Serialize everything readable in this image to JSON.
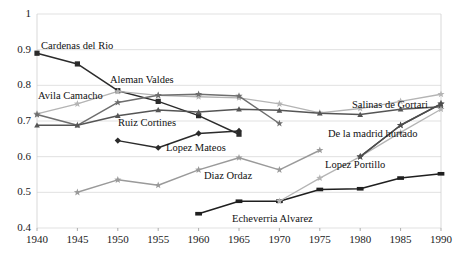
{
  "chart_data": {
    "type": "line",
    "title": "",
    "subtitle": "",
    "xlabel": "",
    "ylabel": "",
    "x": [
      1940,
      1945,
      1950,
      1955,
      1960,
      1965,
      1970,
      1975,
      1980,
      1985,
      1990
    ],
    "xlim": [
      1940,
      1990
    ],
    "ylim": [
      0.4,
      1.0
    ],
    "xticks": [
      "1940",
      "1945",
      "1950",
      "1955",
      "1960",
      "1965",
      "1970",
      "1975",
      "1980",
      "1985",
      "1990"
    ],
    "yticks": [
      "1",
      "0.9",
      "0.8",
      "0.7",
      "0.6",
      "0.5",
      "0.4"
    ],
    "ytick_values": [
      1,
      0.9,
      0.8,
      0.7,
      0.6,
      0.5,
      0.4
    ],
    "grid": true,
    "grid_axis": "y",
    "legend": "inline-annotations",
    "legend_position": "none",
    "marker": "star-square",
    "series": [
      {
        "name": "Cardenas del Rio",
        "color": "#2b2b2b",
        "marker": "square",
        "x": [
          1940,
          1945,
          1950,
          1955,
          1960,
          1965
        ],
        "values": [
          0.89,
          0.86,
          0.785,
          0.755,
          0.715,
          0.663
        ]
      },
      {
        "name": "Avila Camacho",
        "color": "#b4b4b4",
        "marker": "star",
        "x": [
          1940,
          1945,
          1950,
          1955,
          1960,
          1965,
          1970,
          1975,
          1980,
          1985,
          1990
        ],
        "values": [
          0.72,
          0.748,
          0.783,
          0.772,
          0.768,
          0.765,
          0.748,
          0.723,
          0.735,
          0.755,
          0.775
        ]
      },
      {
        "name": "Aleman Valdes",
        "color": "#6e6e6e",
        "marker": "star",
        "x": [
          1940,
          1945,
          1950,
          1955,
          1960,
          1965,
          1970
        ],
        "values": [
          0.718,
          0.688,
          0.752,
          0.772,
          0.775,
          0.77,
          0.693
        ]
      },
      {
        "name": "Ruiz Cortines",
        "color": "#555555",
        "marker": "triangle",
        "x": [
          1940,
          1945,
          1950,
          1955,
          1960,
          1965,
          1970,
          1975,
          1980,
          1985,
          1990
        ],
        "values": [
          0.688,
          0.688,
          0.715,
          0.731,
          0.725,
          0.733,
          0.73,
          0.722,
          0.718,
          0.733,
          0.74
        ]
      },
      {
        "name": "Lopez Mateos",
        "color": "#2b2b2b",
        "marker": "diamond",
        "x": [
          1950,
          1955,
          1960,
          1965
        ],
        "values": [
          0.645,
          0.625,
          0.665,
          0.672
        ]
      },
      {
        "name": "Diaz Ordaz",
        "color": "#9a9a9a",
        "marker": "star",
        "x": [
          1945,
          1950,
          1955,
          1960,
          1965,
          1970,
          1975
        ],
        "values": [
          0.5,
          0.535,
          0.52,
          0.563,
          0.597,
          0.563,
          0.618
        ]
      },
      {
        "name": "Echeverria Alvarez",
        "color": "#1f1f1f",
        "marker": "bar",
        "x": [
          1960,
          1965,
          1970,
          1975,
          1980,
          1985,
          1990
        ],
        "values": [
          0.44,
          0.475,
          0.475,
          0.508,
          0.51,
          0.54,
          0.552
        ]
      },
      {
        "name": "Lopez Portillo",
        "color": "#b4b4b4",
        "marker": "star",
        "x": [
          1970,
          1975,
          1980,
          1985,
          1990
        ],
        "values": [
          0.475,
          0.54,
          0.6,
          0.668,
          0.733
        ]
      },
      {
        "name": "De la madrid hurtado",
        "color": "#4d4d4d",
        "marker": "star",
        "x": [
          1980,
          1985,
          1990
        ],
        "values": [
          0.6,
          0.688,
          0.748
        ]
      },
      {
        "name": "Salinas de Gortari",
        "color": "#4d4d4d",
        "marker": "star",
        "x": [
          1980,
          1985,
          1990
        ],
        "values": [
          0.6,
          0.688,
          0.748
        ]
      }
    ],
    "annotations": [
      {
        "text": "Cardenas del Rio",
        "x": 41,
        "y": 40,
        "color": "#111111"
      },
      {
        "text": "Avila Camacho",
        "x": 38,
        "y": 90,
        "color": "#111111"
      },
      {
        "text": "Aleman Valdes",
        "x": 110,
        "y": 74,
        "color": "#111111"
      },
      {
        "text": "Ruiz Cortines",
        "x": 118,
        "y": 117,
        "color": "#111111"
      },
      {
        "text": "Lopez Mateos",
        "x": 166,
        "y": 142,
        "color": "#111111"
      },
      {
        "text": "Diaz Ordaz",
        "x": 204,
        "y": 170,
        "color": "#111111"
      },
      {
        "text": "Echeverria Alvarez",
        "x": 232,
        "y": 213,
        "color": "#111111"
      },
      {
        "text": "Lopez Portillo",
        "x": 325,
        "y": 159,
        "color": "#111111"
      },
      {
        "text": "De la madrid hurtado",
        "x": 328,
        "y": 128,
        "color": "#111111"
      },
      {
        "text": "Salinas de Gortari",
        "x": 352,
        "y": 99,
        "color": "#111111"
      }
    ]
  },
  "axes": {
    "y_labels": [
      "1",
      "0.9",
      "0.8",
      "0.7",
      "0.6",
      "0.5",
      "0.4"
    ],
    "x_labels": [
      "1940",
      "1945",
      "1950",
      "1955",
      "1960",
      "1965",
      "1970",
      "1975",
      "1980",
      "1985",
      "1990"
    ]
  }
}
